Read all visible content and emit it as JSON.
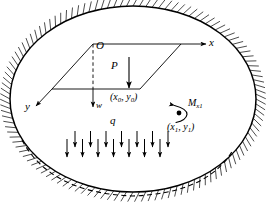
{
  "figure": {
    "background_color": "#ffffff",
    "line_color": "#000000",
    "labels": {
      "origin": "O",
      "axis_x": "x",
      "axis_y": "y",
      "axis_w": "w",
      "point_load": "P",
      "distributed_load": "q",
      "moment": "M",
      "moment_subscript": "x1",
      "point_load_coords_open": "(",
      "point_load_coords_x": "x",
      "point_load_coords_x_sub": "0",
      "point_load_coords_sep": ", ",
      "point_load_coords_y": "y",
      "point_load_coords_y_sub": "0",
      "point_load_coords_close": ")",
      "moment_coords_open": "(",
      "moment_coords_x": "x",
      "moment_coords_x_sub": "1",
      "moment_coords_sep": ", ",
      "moment_coords_y": "y",
      "moment_coords_y_sub": "1",
      "moment_coords_close": ")"
    },
    "geometry": {
      "ellipse_center_x": 133,
      "ellipse_center_y": 99,
      "ellipse_radius_x": 123,
      "ellipse_radius_y": 93,
      "hatch_count": 120,
      "hatch_length": 11,
      "deflected_dash": "dashed inner curve at lower boundary",
      "distributed_load_arrows_top_row": 7,
      "distributed_load_arrows_bottom_row": 7
    }
  }
}
